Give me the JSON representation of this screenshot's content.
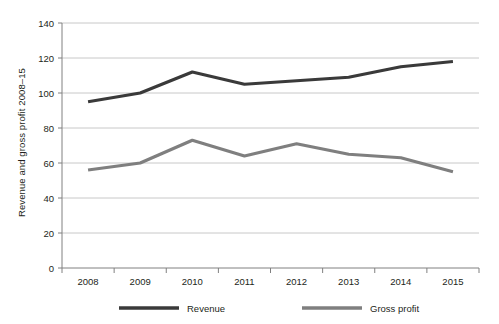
{
  "chart_data": {
    "type": "line",
    "title": "",
    "xlabel": "",
    "ylabel": "Revenue and gross profit 2008–15",
    "categories": [
      "2008",
      "2009",
      "2010",
      "2011",
      "2012",
      "2013",
      "2014",
      "2015"
    ],
    "x": [
      2008,
      2009,
      2010,
      2011,
      2012,
      2013,
      2014,
      2015
    ],
    "ylim": [
      0,
      140
    ],
    "yticks": [
      0,
      20,
      40,
      60,
      80,
      100,
      120,
      140
    ],
    "ytick_labels": [
      "0",
      "20",
      "40",
      "60",
      "80",
      "100",
      "120",
      "140"
    ],
    "grid": "horizontal",
    "legend_position": "bottom",
    "series": [
      {
        "name": "Revenue",
        "color": "#3a3a3a",
        "values": [
          95,
          100,
          112,
          105,
          107,
          109,
          115,
          118
        ]
      },
      {
        "name": "Gross profit",
        "color": "#7f7f7f",
        "values": [
          56,
          60,
          73,
          64,
          71,
          65,
          63,
          55
        ]
      }
    ]
  },
  "legend": {
    "items": [
      {
        "label": "Revenue",
        "color": "#3a3a3a"
      },
      {
        "label": "Gross profit",
        "color": "#7f7f7f"
      }
    ]
  },
  "axis": {
    "line_color": "#808080",
    "grid_color": "#c8c8c8"
  }
}
